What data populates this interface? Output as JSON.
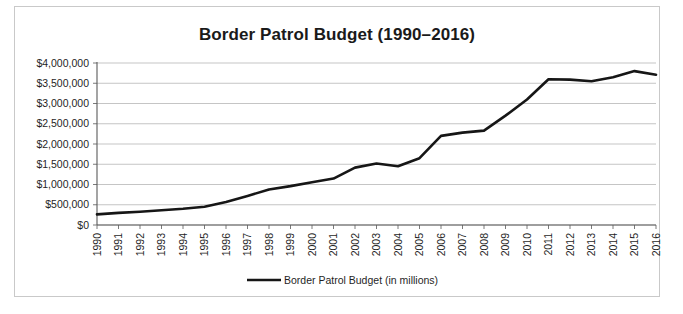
{
  "chart_data": {
    "type": "line",
    "title": "Border Patrol Budget (1990–2016)",
    "xlabel": "",
    "ylabel": "",
    "ylim": [
      0,
      4000000
    ],
    "ytick_labels": [
      "$4,000,000",
      "$3,500,000",
      "$3,000,000",
      "$2,500,000",
      "$2,000,000",
      "$1,500,000",
      "$1,000,000",
      "$500,000",
      "$0"
    ],
    "ytick_values": [
      4000000,
      3500000,
      3000000,
      2500000,
      2000000,
      1500000,
      1000000,
      500000,
      0
    ],
    "grid": true,
    "legend_position": "bottom",
    "legend": [
      "Border Patrol Budget (in millions)"
    ],
    "categories": [
      "1990",
      "1991",
      "1992",
      "1993",
      "1994",
      "1995",
      "1996",
      "1997",
      "1998",
      "1999",
      "2000",
      "2001",
      "2002",
      "2003",
      "2004",
      "2005",
      "2006",
      "2007",
      "2008",
      "2009",
      "2010",
      "2011",
      "2012",
      "2013",
      "2014",
      "2015",
      "2016"
    ],
    "series": [
      {
        "name": "Border Patrol Budget (in millions)",
        "values": [
          263000,
          300000,
          327000,
          363000,
          400000,
          452000,
          568000,
          717000,
          877000,
          960000,
          1055000,
          1146000,
          1416000,
          1520000,
          1450000,
          1650000,
          2200000,
          2280000,
          2330000,
          2700000,
          3100000,
          3600000,
          3590000,
          3550000,
          3650000,
          3800000,
          3710000
        ]
      }
    ]
  },
  "chart": {
    "title": "Border Patrol Budget (1990–2016)",
    "legend_label": "Border Patrol Budget (in millions)"
  },
  "colors": {
    "line": "#161616",
    "grid": "#b6b6b6",
    "axis": "#5a5a5a",
    "frame": "#c9c9c9",
    "text": "#1f1f1f",
    "background": "#ffffff"
  }
}
